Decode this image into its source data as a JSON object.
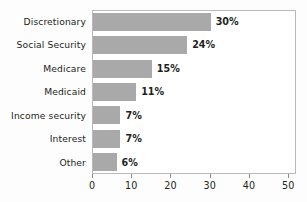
{
  "chart_data": {
    "type": "bar",
    "orientation": "horizontal",
    "title": "",
    "subtitle": "",
    "xlabel": "",
    "ylabel": "",
    "categories": [
      "Discretionary",
      "Social Security",
      "Medicare",
      "Medicaid",
      "Income security",
      "Interest",
      "Other"
    ],
    "values": [
      30,
      24,
      15,
      11,
      7,
      7,
      6
    ],
    "data_labels": [
      "30%",
      "24%",
      "15%",
      "11%",
      "7%",
      "7%",
      "6%"
    ],
    "xlim": [
      0,
      52
    ],
    "xticks": [
      0,
      10,
      20,
      30,
      40,
      50
    ],
    "xtick_labels": [
      "0",
      "10",
      "20",
      "30",
      "40",
      "50"
    ],
    "grid": false,
    "legend": null,
    "colors": {
      "bar_fill": "#a9a9a9",
      "text": "#231f20",
      "frame": "#b9b9b9",
      "background": "#ffffff"
    }
  }
}
